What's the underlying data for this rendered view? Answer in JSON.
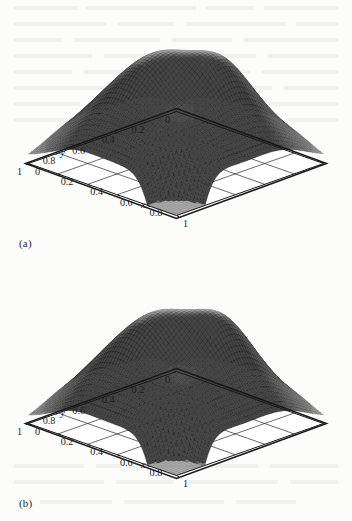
{
  "figure": {
    "type": "two-panel-3d-surface-plot",
    "background_color": "#fcfcfb",
    "ink_color": "#1d1d20",
    "panels": [
      {
        "id": "a",
        "label": "(a)",
        "axes": {
          "x": {
            "name": "x",
            "ticks": [
              "0",
              "0.2",
              "0.4",
              "0.6",
              "0.8",
              "1"
            ],
            "values": [
              0,
              0.2,
              0.4,
              0.6,
              0.8,
              1
            ],
            "range": [
              0,
              1
            ],
            "side": "right"
          },
          "y": {
            "name": "y",
            "ticks": [
              "0",
              "0.2",
              "0.4",
              "0.6",
              "0.8",
              "1"
            ],
            "values": [
              0,
              0.2,
              0.4,
              0.6,
              0.8,
              1
            ],
            "range": [
              0,
              1
            ],
            "side": "left"
          }
        }
      },
      {
        "id": "b",
        "label": "(b)",
        "axes": {
          "x": {
            "name": "x",
            "ticks": [
              "0",
              "0.2",
              "0.4",
              "0.6",
              "0.8",
              "1"
            ],
            "values": [
              0,
              0.2,
              0.4,
              0.6,
              0.8,
              1
            ],
            "range": [
              0,
              1
            ],
            "side": "right"
          },
          "y": {
            "name": "y",
            "ticks": [
              "0",
              "0.2",
              "0.4",
              "0.6",
              "0.8",
              "1"
            ],
            "values": [
              0,
              0.2,
              0.4,
              0.6,
              0.8,
              1
            ],
            "range": [
              0,
              1
            ],
            "side": "left"
          }
        }
      }
    ]
  },
  "chart_data": [
    {
      "type": "surface",
      "panel": "a",
      "title": "",
      "xlabel": "x",
      "ylabel": "y",
      "zlabel": "",
      "xlim": [
        0,
        1
      ],
      "ylim": [
        0,
        1
      ],
      "xticks": [
        0,
        0.2,
        0.4,
        0.6,
        0.8,
        1
      ],
      "yticks": [
        0,
        0.2,
        0.4,
        0.6,
        0.8,
        1
      ],
      "xticklabels": [
        "0",
        "0.2",
        "0.4",
        "0.6",
        "0.8",
        "1"
      ],
      "yticklabels": [
        "0",
        "0.2",
        "0.4",
        "0.6",
        "0.8",
        "1"
      ],
      "grid": true,
      "legend": false,
      "mesh": {
        "nx": 56,
        "ny": 56,
        "style": "wireframe-shaded",
        "colormap": "gray"
      },
      "description": "Plateau-shaped solution surface with oscillatory ripples on the flat top, steep skirts falling to zero at the domain boundary, and a deep notch at the near corner",
      "surface_model": {
        "plateau_steepness": 9.0,
        "plateau_margin": 0.1,
        "base_amplitude": 1.0,
        "ripple_terms": [
          {
            "amp": 0.105,
            "fx": 3.0,
            "fy": 2.0,
            "px": 0.35,
            "py": 0.15
          },
          {
            "amp": 0.082,
            "fx": 2.0,
            "fy": 3.0,
            "px": 1.05,
            "py": 0.6
          },
          {
            "amp": 0.06,
            "fx": 4.0,
            "fy": 1.0,
            "px": 0.2,
            "py": 1.4
          },
          {
            "amp": 0.048,
            "fx": 1.0,
            "fy": 4.0,
            "px": 2.1,
            "py": 0.3
          },
          {
            "amp": 0.036,
            "fx": 5.0,
            "fy": 3.0,
            "px": 0.9,
            "py": 2.2
          }
        ],
        "notch": {
          "cx": 0.93,
          "cy": 0.93,
          "depth": 1.08,
          "sigma": 0.085
        }
      }
    },
    {
      "type": "surface",
      "panel": "b",
      "title": "",
      "xlabel": "x",
      "ylabel": "y",
      "zlabel": "",
      "xlim": [
        0,
        1
      ],
      "ylim": [
        0,
        1
      ],
      "xticks": [
        0,
        0.2,
        0.4,
        0.6,
        0.8,
        1
      ],
      "yticks": [
        0,
        0.2,
        0.4,
        0.6,
        0.8,
        1
      ],
      "xticklabels": [
        "0",
        "0.2",
        "0.4",
        "0.6",
        "0.8",
        "1"
      ],
      "yticklabels": [
        "0",
        "0.2",
        "0.4",
        "0.6",
        "0.8",
        "1"
      ],
      "grid": true,
      "legend": false,
      "mesh": {
        "nx": 56,
        "ny": 56,
        "style": "wireframe-shaded",
        "colormap": "gray"
      },
      "description": "Companion plateau surface nearly identical to panel (a), with slightly sharper ripple crests and the same near-corner notch",
      "surface_model": {
        "plateau_steepness": 9.6,
        "plateau_margin": 0.1,
        "base_amplitude": 1.0,
        "ripple_terms": [
          {
            "amp": 0.118,
            "fx": 3.0,
            "fy": 2.0,
            "px": 0.3,
            "py": 0.18
          },
          {
            "amp": 0.09,
            "fx": 2.0,
            "fy": 3.0,
            "px": 1.0,
            "py": 0.66
          },
          {
            "amp": 0.066,
            "fx": 4.0,
            "fy": 1.0,
            "px": 0.26,
            "py": 1.36
          },
          {
            "amp": 0.052,
            "fx": 1.0,
            "fy": 4.0,
            "px": 2.04,
            "py": 0.34
          },
          {
            "amp": 0.04,
            "fx": 5.0,
            "fy": 3.0,
            "px": 0.84,
            "py": 2.16
          }
        ],
        "notch": {
          "cx": 0.93,
          "cy": 0.93,
          "depth": 1.1,
          "sigma": 0.082
        }
      }
    }
  ]
}
